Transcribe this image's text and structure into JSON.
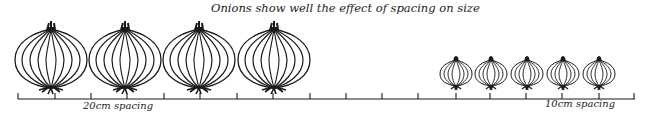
{
  "title": "Onions show well the effect of spacing on size",
  "labels": {
    "wide": "20cm spacing",
    "narrow": "10cm spacing"
  },
  "groups": [
    {
      "name": "large-onions",
      "spacing": "20cm",
      "count": 4,
      "centers_x": [
        51,
        128,
        202,
        276
      ],
      "width": 72,
      "height": 70
    },
    {
      "name": "small-onions",
      "spacing": "10cm",
      "count": 5,
      "centers_x": [
        456,
        490,
        526,
        562,
        599
      ],
      "width": 32,
      "height": 31
    }
  ],
  "ruler": {
    "x_start": 18,
    "x_end": 635,
    "y": 99,
    "ticks": [
      18,
      55,
      91,
      127,
      164,
      200,
      237,
      273,
      310,
      346,
      382,
      418,
      456,
      490,
      526,
      562,
      599,
      634
    ]
  },
  "colors": {
    "ink": "#1a1a1a",
    "background": "#ffffff"
  }
}
